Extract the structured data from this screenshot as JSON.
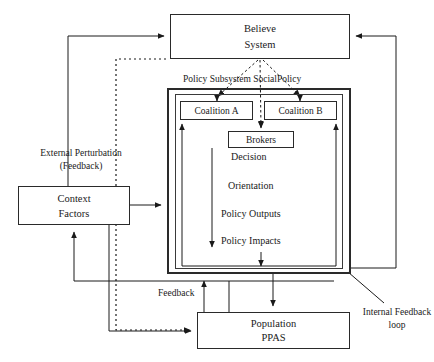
{
  "diagram": {
    "colors": {
      "stroke": "#2a2a2a",
      "text": "#1a1a1a",
      "background": "#ffffff"
    },
    "boxes": {
      "believe_system": {
        "line1": "Believe",
        "line2": "System"
      },
      "coalition_a": {
        "label": "Coalition A"
      },
      "coalition_b": {
        "label": "Coalition B"
      },
      "brokers": {
        "label": "Brokers"
      },
      "context_factors": {
        "line1": "Context",
        "line2": "Factors"
      },
      "population": {
        "line1": "Population",
        "line2": "PPAS"
      }
    },
    "labels": {
      "policy_subsystem": "Policy Subsystem SocialPolicy",
      "external_perturbation": "External Perturbation (Feedback)",
      "feedback": "Feedback",
      "internal_feedback_loop": "Internal Feedback loop"
    },
    "flow_steps": [
      {
        "label": "Decision"
      },
      {
        "label": "Orientation"
      },
      {
        "label": "Policy Outputs"
      },
      {
        "label": "Policy Impacts"
      }
    ]
  }
}
